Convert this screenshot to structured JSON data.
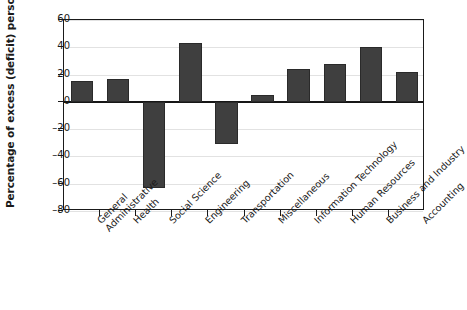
{
  "chart_data": {
    "type": "bar",
    "title": "",
    "xlabel": "",
    "ylabel": "Percentage of excess (deficit) personnel",
    "ylim": [
      -80,
      60
    ],
    "yticks": [
      60,
      40,
      20,
      0,
      -20,
      -40,
      -60,
      -80
    ],
    "ytick_labels": [
      "60",
      "40",
      "20",
      "0",
      "–20",
      "–40",
      "–60",
      "–80"
    ],
    "grid": true,
    "legend": null,
    "bar_color": "#3f3f3f",
    "categories": [
      "General Administrative",
      "Health",
      "Social Science",
      "Engineering",
      "Transportation",
      "Miscellaneous",
      "Information Technology",
      "Human Resources",
      "Business and Industry",
      "Accounting"
    ],
    "category_lines": [
      [
        "General",
        "Administrative"
      ],
      [
        "Health"
      ],
      [
        "Social Science"
      ],
      [
        "Engineering"
      ],
      [
        "Transportation"
      ],
      [
        "Miscellaneous"
      ],
      [
        "Information Technology"
      ],
      [
        "Human Resources"
      ],
      [
        "Business and Industry"
      ],
      [
        "Accounting"
      ]
    ],
    "values": [
      15,
      17,
      -63,
      43,
      -31,
      5,
      24,
      28,
      40,
      22
    ]
  }
}
